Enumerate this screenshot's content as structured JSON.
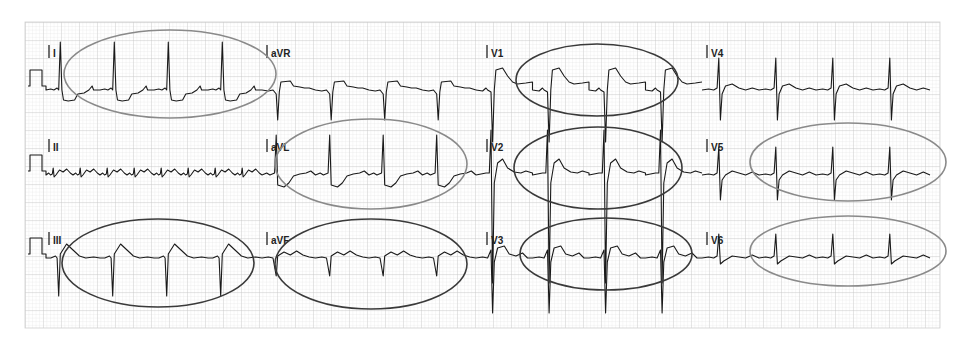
{
  "figure": {
    "type": "12-lead electrocardiogram",
    "grid": {
      "x": 25,
      "y": 22,
      "width": 915,
      "height": 306,
      "small_square_px": 3.6,
      "large_square_px": 18,
      "minor_color": "#e6e6e6",
      "major_color": "#c8c8c8"
    },
    "trace_color": "#1a1a1a",
    "annotation_colors": {
      "dark": "#3a3a3a",
      "light": "#8a8a8a"
    }
  },
  "leads": [
    {
      "id": "I",
      "label": "I",
      "row": 0,
      "col": 0,
      "morphology": "upright QRS, ST depression"
    },
    {
      "id": "aVR",
      "label": "aVR",
      "row": 0,
      "col": 1,
      "morphology": "negative QRS, ST elevation"
    },
    {
      "id": "V1",
      "label": "V1",
      "row": 0,
      "col": 2,
      "morphology": "deep S, ST elevation"
    },
    {
      "id": "V4",
      "label": "V4",
      "row": 0,
      "col": 3,
      "morphology": "RS complex"
    },
    {
      "id": "II",
      "label": "II",
      "row": 1,
      "col": 0,
      "morphology": "low amplitude"
    },
    {
      "id": "aVL",
      "label": "aVL",
      "row": 1,
      "col": 1,
      "morphology": "upright QRS, ST depression"
    },
    {
      "id": "V2",
      "label": "V2",
      "row": 1,
      "col": 2,
      "morphology": "very large RS, ST elevation"
    },
    {
      "id": "V5",
      "label": "V5",
      "row": 1,
      "col": 3,
      "morphology": "RS complex"
    },
    {
      "id": "III",
      "label": "III",
      "row": 2,
      "col": 0,
      "morphology": "deep S, ST elevation"
    },
    {
      "id": "aVF",
      "label": "aVF",
      "row": 2,
      "col": 1,
      "morphology": "small negative QRS"
    },
    {
      "id": "V3",
      "label": "V3",
      "row": 2,
      "col": 2,
      "morphology": "deep S, ST elevation"
    },
    {
      "id": "V6",
      "label": "V6",
      "row": 2,
      "col": 3,
      "morphology": "upright small QRS"
    }
  ],
  "annotations": [
    {
      "name": "ellipse-lead-I",
      "cx": 170,
      "cy": 74,
      "rx": 106,
      "ry": 44,
      "tone": "light"
    },
    {
      "name": "ellipse-lead-aVL",
      "cx": 371,
      "cy": 164,
      "rx": 96,
      "ry": 45,
      "tone": "light"
    },
    {
      "name": "ellipse-lead-III",
      "cx": 158,
      "cy": 263,
      "rx": 96,
      "ry": 44,
      "tone": "dark"
    },
    {
      "name": "ellipse-lead-aVF",
      "cx": 371,
      "cy": 264,
      "rx": 96,
      "ry": 45,
      "tone": "dark"
    },
    {
      "name": "ellipse-lead-V1",
      "cx": 597,
      "cy": 80,
      "rx": 81,
      "ry": 36,
      "tone": "dark"
    },
    {
      "name": "ellipse-lead-V2",
      "cx": 598,
      "cy": 168,
      "rx": 84,
      "ry": 41,
      "tone": "dark"
    },
    {
      "name": "ellipse-lead-V3",
      "cx": 606,
      "cy": 254,
      "rx": 86,
      "ry": 36,
      "tone": "dark"
    },
    {
      "name": "ellipse-lead-V5",
      "cx": 848,
      "cy": 162,
      "rx": 98,
      "ry": 39,
      "tone": "light"
    },
    {
      "name": "ellipse-lead-V6",
      "cx": 848,
      "cy": 251,
      "rx": 98,
      "ry": 35,
      "tone": "light"
    }
  ]
}
